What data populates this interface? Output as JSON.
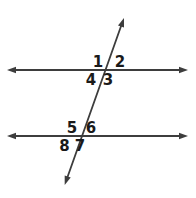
{
  "diagram": {
    "colors": {
      "line": "#3d3d3d",
      "label": "#1a1a1a",
      "background": "#ffffff"
    },
    "angles": {
      "a1": "1",
      "a2": "2",
      "a3": "3",
      "a4": "4",
      "a5": "5",
      "a6": "6",
      "a7": "7",
      "a8": "8"
    }
  }
}
